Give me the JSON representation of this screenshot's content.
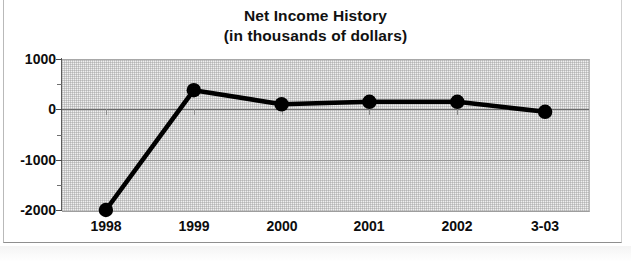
{
  "chart_data": {
    "type": "line",
    "title": "Net Income History",
    "subtitle": "(in thousands of dollars)",
    "xlabel": "",
    "ylabel": "",
    "categories": [
      "1998",
      "1999",
      "2000",
      "2001",
      "2002",
      "3-03"
    ],
    "values": [
      -2000,
      380,
      100,
      150,
      150,
      -50
    ],
    "series": [
      {
        "name": "Net Income",
        "values": [
          -2000,
          380,
          100,
          150,
          150,
          -50
        ]
      }
    ],
    "ylim": [
      -2000,
      1000
    ],
    "ytick_labels": [
      "1000",
      "0",
      "-1000",
      "-2000"
    ],
    "ytick_values": [
      1000,
      0,
      -1000,
      -2000
    ],
    "yminor_values": [
      500,
      -500,
      -1500
    ],
    "grid": true,
    "legend": "none",
    "marker": "filled-circle",
    "line_color": "#000000",
    "marker_color": "#000000",
    "plot_background": "#f0f0f0",
    "text_color": "#0d0d0d"
  },
  "axis": {
    "y_labels": [
      {
        "text": "1000",
        "value": 1000
      },
      {
        "text": "0",
        "value": 0
      },
      {
        "text": "-1000",
        "value": -1000
      },
      {
        "text": "-2000",
        "value": -2000
      }
    ],
    "x_labels": [
      {
        "text": "1998"
      },
      {
        "text": "1999"
      },
      {
        "text": "2000"
      },
      {
        "text": "2001"
      },
      {
        "text": "2002"
      },
      {
        "text": "3-03"
      }
    ]
  }
}
